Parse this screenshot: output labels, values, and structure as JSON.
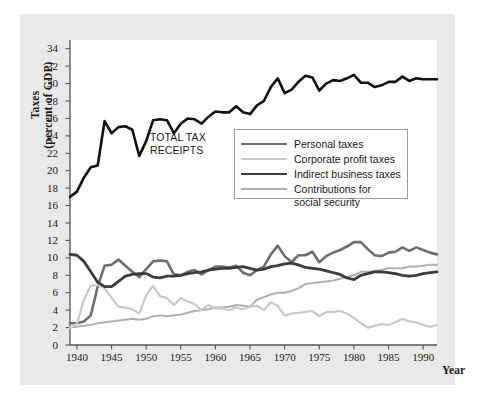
{
  "figure": {
    "background": "#ffffff",
    "panel_color": "#e9e9e9",
    "plot_background": "#ffffff",
    "axis_color": "#555555"
  },
  "annotation": {
    "line1": "TOTAL TAX",
    "line2": "RECEIPTS"
  },
  "axis_titles": {
    "y_line1": "Taxes",
    "y_line2": "(percent of GDP)",
    "x": "Year"
  },
  "legend": {
    "entries": [
      {
        "label": "Personal taxes",
        "color": "#6e6e6e",
        "width": 2.6
      },
      {
        "label": "Corporate profit taxes",
        "color": "#c9c9c9",
        "width": 2.2
      },
      {
        "label": "Indirect business taxes",
        "color": "#3c3c3c",
        "width": 2.8
      },
      {
        "label": "Contributions for",
        "color": "#b0b0b0",
        "width": 2.0
      }
    ],
    "wrapped_label": "social security"
  },
  "chart_data": {
    "type": "line",
    "title": "",
    "subtitle": "",
    "xlabel": "Year",
    "ylabel": "Taxes (percent of GDP)",
    "xlim": [
      1939,
      1992
    ],
    "ylim": [
      0,
      35
    ],
    "yticks": [
      0,
      2,
      4,
      6,
      8,
      10,
      12,
      14,
      16,
      18,
      20,
      22,
      24,
      26,
      28,
      30,
      32,
      34
    ],
    "xticks": [
      1940,
      1945,
      1950,
      1955,
      1960,
      1965,
      1970,
      1975,
      1980,
      1985,
      1990
    ],
    "grid": false,
    "legend_position": "upper-center-right",
    "annotations": [
      {
        "text": "TOTAL TAX RECEIPTS",
        "x": 1951,
        "y": 23.0
      }
    ],
    "x": [
      1939,
      1940,
      1941,
      1942,
      1943,
      1944,
      1945,
      1946,
      1947,
      1948,
      1949,
      1950,
      1951,
      1952,
      1953,
      1954,
      1955,
      1956,
      1957,
      1958,
      1959,
      1960,
      1961,
      1962,
      1963,
      1964,
      1965,
      1966,
      1967,
      1968,
      1969,
      1970,
      1971,
      1972,
      1973,
      1974,
      1975,
      1976,
      1977,
      1978,
      1979,
      1980,
      1981,
      1982,
      1983,
      1984,
      1985,
      1986,
      1987,
      1988,
      1989,
      1990,
      1991,
      1992
    ],
    "series": [
      {
        "name": "Total tax receipts",
        "color": "#111111",
        "width": 2.6,
        "labeled_on_plot": true,
        "values": [
          17.0,
          17.6,
          19.2,
          20.4,
          20.6,
          25.7,
          24.3,
          25.0,
          25.1,
          24.7,
          21.7,
          23.4,
          25.8,
          25.9,
          25.8,
          24.3,
          25.4,
          26.0,
          25.9,
          25.4,
          26.2,
          26.8,
          26.7,
          26.7,
          27.4,
          26.7,
          26.5,
          27.5,
          28.0,
          29.6,
          30.6,
          28.9,
          29.3,
          30.2,
          30.9,
          30.7,
          29.2,
          30.0,
          30.4,
          30.3,
          30.6,
          31.0,
          30.1,
          30.1,
          29.6,
          29.8,
          30.2,
          30.2,
          30.8,
          30.3,
          30.6,
          30.5,
          30.5,
          30.5
        ]
      },
      {
        "name": "Personal taxes",
        "color": "#6e6e6e",
        "width": 2.6,
        "values": [
          2.5,
          2.5,
          2.7,
          3.4,
          6.7,
          9.1,
          9.2,
          9.8,
          9.1,
          8.4,
          7.8,
          8.7,
          9.6,
          9.7,
          9.6,
          8.1,
          8.0,
          8.4,
          8.6,
          8.1,
          8.6,
          9.0,
          9.0,
          8.9,
          9.1,
          8.3,
          8.0,
          8.6,
          9.0,
          10.4,
          11.4,
          10.2,
          9.5,
          10.3,
          10.3,
          10.7,
          9.5,
          10.2,
          10.6,
          10.9,
          11.3,
          11.8,
          11.8,
          11.0,
          10.3,
          10.2,
          10.6,
          10.7,
          11.2,
          10.8,
          11.2,
          10.9,
          10.6,
          10.4
        ]
      },
      {
        "name": "Corporate profit taxes",
        "color": "#c9c9c9",
        "width": 2.2,
        "values": [
          2.0,
          2.4,
          5.2,
          6.8,
          6.9,
          6.5,
          5.4,
          4.4,
          4.3,
          4.1,
          3.6,
          5.7,
          6.8,
          5.6,
          5.4,
          4.6,
          5.4,
          5.0,
          4.7,
          4.0,
          4.6,
          4.2,
          4.2,
          4.0,
          4.3,
          4.1,
          4.4,
          4.5,
          4.0,
          4.9,
          4.5,
          3.4,
          3.6,
          3.7,
          3.8,
          3.9,
          3.3,
          3.8,
          3.8,
          3.9,
          3.6,
          3.1,
          2.5,
          2.0,
          2.2,
          2.4,
          2.3,
          2.6,
          3.0,
          2.7,
          2.6,
          2.3,
          2.1,
          2.3
        ]
      },
      {
        "name": "Indirect business taxes",
        "color": "#3c3c3c",
        "width": 2.8,
        "values": [
          10.4,
          10.3,
          9.6,
          8.4,
          7.2,
          6.7,
          6.7,
          7.3,
          7.9,
          8.1,
          8.2,
          8.2,
          7.8,
          7.7,
          7.9,
          7.9,
          8.0,
          8.2,
          8.3,
          8.4,
          8.6,
          8.7,
          8.8,
          8.8,
          8.9,
          9.0,
          8.8,
          8.6,
          8.7,
          9.0,
          9.1,
          9.3,
          9.4,
          9.2,
          8.9,
          8.8,
          8.7,
          8.5,
          8.3,
          8.1,
          7.7,
          7.5,
          8.0,
          8.2,
          8.4,
          8.4,
          8.3,
          8.2,
          8.0,
          7.9,
          8.0,
          8.2,
          8.3,
          8.4
        ]
      },
      {
        "name": "Contributions for social security",
        "color": "#b0b0b0",
        "width": 2.0,
        "values": [
          2.0,
          2.1,
          2.2,
          2.3,
          2.5,
          2.6,
          2.7,
          2.8,
          2.9,
          3.0,
          2.9,
          3.0,
          3.3,
          3.4,
          3.3,
          3.4,
          3.5,
          3.7,
          3.9,
          4.0,
          4.1,
          4.3,
          4.3,
          4.4,
          4.6,
          4.5,
          4.4,
          5.2,
          5.5,
          5.8,
          6.0,
          6.0,
          6.2,
          6.5,
          7.0,
          7.1,
          7.2,
          7.3,
          7.4,
          7.6,
          7.8,
          8.0,
          8.4,
          8.4,
          8.5,
          8.6,
          8.8,
          8.8,
          8.8,
          9.0,
          9.0,
          9.1,
          9.2,
          9.2
        ]
      }
    ]
  }
}
